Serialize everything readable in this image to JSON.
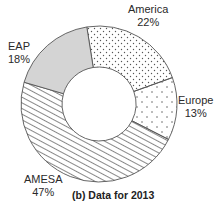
{
  "chart_data": {
    "type": "pie",
    "variant": "donut",
    "title": "(b) Data for 2013",
    "categories": [
      "America",
      "Europe",
      "AMESA",
      "EAP"
    ],
    "values": [
      22,
      13,
      47,
      18
    ],
    "unit": "%",
    "series": [
      {
        "name": "America",
        "value": 22,
        "label": "22%",
        "fill": "dotted-dense"
      },
      {
        "name": "Europe",
        "value": 13,
        "label": "13%",
        "fill": "dotted-sparse"
      },
      {
        "name": "AMESA",
        "value": 47,
        "label": "47%",
        "fill": "diagonal-hatch"
      },
      {
        "name": "EAP",
        "value": 18,
        "label": "18%",
        "fill": "solid-gray"
      }
    ],
    "legend": "none (labels placed outside slices)",
    "grid": false
  },
  "colors": {
    "outline": "#555555",
    "eap_fill": "#d4d4d4",
    "hatch": "#6a6a6a",
    "dot": "#555555",
    "text": "#2a2a2a"
  },
  "labels": {
    "america": {
      "name": "America",
      "pct": "22%"
    },
    "europe": {
      "name": "Europe",
      "pct": "13%"
    },
    "amesa": {
      "name": "AMESA",
      "pct": "47%"
    },
    "eap": {
      "name": "EAP",
      "pct": "18%"
    }
  },
  "caption": "(b) Data for 2013"
}
